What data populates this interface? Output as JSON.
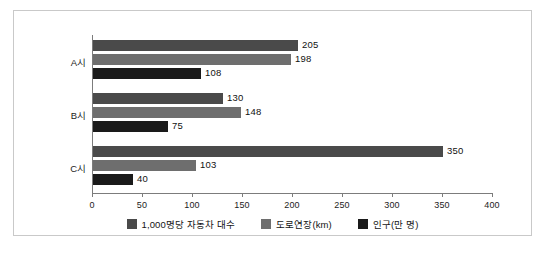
{
  "chart_data": {
    "type": "bar",
    "orientation": "horizontal",
    "title": "",
    "xlabel": "",
    "ylabel": "",
    "categories": [
      "A시",
      "B시",
      "C시"
    ],
    "series": [
      {
        "name": "1,000명당 자동차 대수",
        "color": "#4a4a4a",
        "values": [
          205,
          130,
          350
        ]
      },
      {
        "name": "도로연장(km)",
        "color": "#6e6e6e",
        "values": [
          198,
          148,
          103
        ]
      },
      {
        "name": "인구(만 명)",
        "color": "#1a1a1a",
        "values": [
          108,
          75,
          40
        ]
      }
    ],
    "xlim": [
      0,
      400
    ],
    "xticks": [
      0,
      50,
      100,
      150,
      200,
      250,
      300,
      350,
      400
    ],
    "xtick_labels": [
      "0",
      "50",
      "100",
      "150",
      "200",
      "250",
      "300",
      "350",
      "400"
    ],
    "grid": false,
    "legend_position": "bottom",
    "axis_color": "#7c7c7c",
    "border_color": "#c9c9c9",
    "background_color": "#ffffff"
  }
}
